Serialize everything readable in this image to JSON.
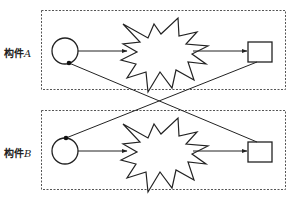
{
  "diagram": {
    "type": "component-connection-diagram",
    "components": [
      {
        "id": "A",
        "label_prefix": "构件",
        "label_var": "A",
        "full_label": "构件A",
        "nodes": [
          "input-port-circle",
          "processing-star",
          "output-port-square"
        ]
      },
      {
        "id": "B",
        "label_prefix": "构件",
        "label_var": "B",
        "full_label": "构件B",
        "nodes": [
          "input-port-circle",
          "processing-star",
          "output-port-square"
        ]
      }
    ],
    "connections": [
      {
        "from": "A.input-port-circle",
        "to": "A.processing-star",
        "type": "arrow"
      },
      {
        "from": "A.processing-star",
        "to": "A.output-port-square",
        "type": "arrow"
      },
      {
        "from": "B.input-port-circle",
        "to": "B.processing-star",
        "type": "arrow"
      },
      {
        "from": "B.processing-star",
        "to": "B.output-port-square",
        "type": "arrow"
      },
      {
        "from": "A.output-port-square",
        "to": "B.input-port-circle",
        "type": "line-to-dot"
      },
      {
        "from": "B.output-port-square",
        "to": "A.input-port-circle",
        "type": "line-to-dot"
      }
    ],
    "colors": {
      "stroke": "#222222",
      "dashed_border": "#555555",
      "background": "#ffffff"
    }
  }
}
